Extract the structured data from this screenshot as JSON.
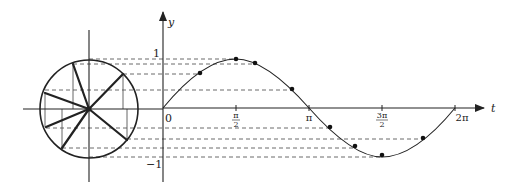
{
  "diagram": {
    "type": "unit-circle-sine-projection",
    "colors": {
      "stroke": "#222222",
      "dash": "#444444",
      "background": "#ffffff"
    },
    "axes": {
      "t_label": "t",
      "y_label": "y",
      "origin_label": "0",
      "y_max_label": "1",
      "y_min_label": "−1",
      "ticks": [
        {
          "id": "half_pi",
          "num": "π",
          "den": "2"
        },
        {
          "id": "pi",
          "label": "π"
        },
        {
          "id": "three_half_pi",
          "num": "3π",
          "den": "2"
        },
        {
          "id": "two_pi",
          "label": "2π"
        }
      ]
    },
    "circle": {
      "center": [
        89,
        109
      ],
      "radius": 49,
      "radius_endpoints": [
        [
          73,
          64
        ],
        [
          123,
          74
        ],
        [
          45,
          93
        ],
        [
          46,
          127
        ],
        [
          62,
          148
        ],
        [
          127,
          140
        ]
      ]
    },
    "curve_points": [
      {
        "x": 200,
        "y": 73
      },
      {
        "x": 236,
        "y": 59
      },
      {
        "x": 255,
        "y": 63
      },
      {
        "x": 292,
        "y": 89
      },
      {
        "x": 330,
        "y": 128
      },
      {
        "x": 355,
        "y": 148
      },
      {
        "x": 382,
        "y": 157
      },
      {
        "x": 423,
        "y": 139
      }
    ]
  }
}
